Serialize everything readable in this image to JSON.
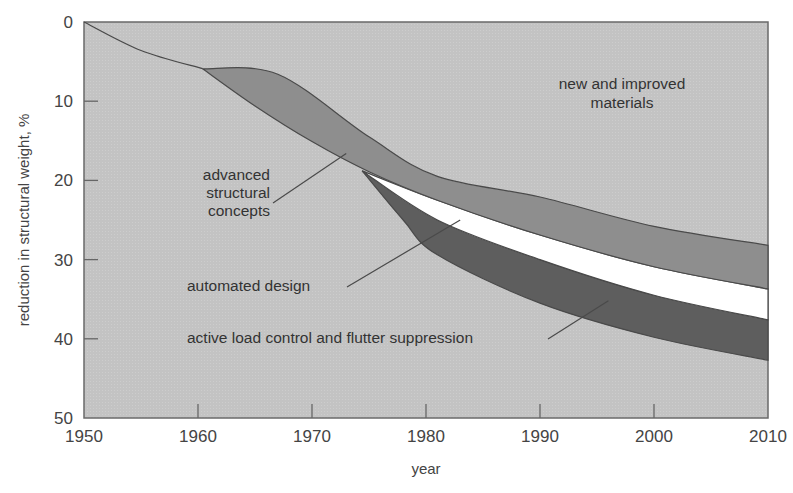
{
  "chart_data": {
    "type": "area",
    "title": "",
    "xlabel": "year",
    "ylabel": "reduction in structural weight, %",
    "xlim": [
      1950,
      2010
    ],
    "ylim": [
      50,
      0
    ],
    "y_inverted": true,
    "x_ticks": [
      1950,
      1960,
      1970,
      1980,
      1990,
      2000,
      2010
    ],
    "y_ticks": [
      0,
      10,
      20,
      30,
      40,
      50
    ],
    "grid": false,
    "legend": "none (inline annotations)",
    "series": [
      {
        "name": "new and improved materials",
        "role": "baseline curve / background region",
        "x": [
          1950,
          1955,
          1960.4
        ],
        "y": [
          0,
          3.6,
          5.9
        ]
      },
      {
        "name": "advanced structural concepts",
        "role": "band",
        "upper_edge": {
          "x": [
            1960.4,
            1967,
            1975,
            1981,
            1990,
            2000,
            2010
          ],
          "y": [
            5.9,
            6.6,
            14.5,
            19.5,
            22.1,
            25.8,
            28.2
          ]
        },
        "lower_edge": {
          "x": [
            1960.4,
            1965,
            1970,
            1975,
            1981,
            1990,
            2000,
            2010
          ],
          "y": [
            5.9,
            10.6,
            15.1,
            18.9,
            22.5,
            26.9,
            30.9,
            33.7
          ]
        }
      },
      {
        "name": "automated design",
        "role": "band",
        "upper_edge": {
          "x": [
            1974.4,
            1981,
            1990,
            2000,
            2010
          ],
          "y": [
            18.8,
            22.5,
            26.9,
            30.9,
            33.7
          ]
        },
        "lower_edge": {
          "x": [
            1974.4,
            1981,
            1990,
            2000,
            2010
          ],
          "y": [
            18.8,
            25.0,
            30.0,
            34.5,
            37.6
          ]
        }
      },
      {
        "name": "active load control and flutter suppression",
        "role": "band",
        "upper_edge": {
          "x": [
            1974.4,
            1981,
            1990,
            2000,
            2010
          ],
          "y": [
            18.8,
            25.0,
            30.0,
            34.5,
            37.6
          ]
        },
        "lower_edge": {
          "x": [
            1974.4,
            1978,
            1981,
            1990,
            2000,
            2010
          ],
          "y": [
            18.8,
            25.0,
            29.4,
            35.5,
            39.8,
            42.7
          ]
        }
      }
    ],
    "annotations": [
      {
        "text": "new and improved materials",
        "x": 1996,
        "y": 10
      },
      {
        "text": "advanced structural concepts",
        "x": 1966,
        "y": 23,
        "pointer_to": [
          1973,
          16.6
        ]
      },
      {
        "text": "automated design",
        "x": 1965,
        "y": 33,
        "pointer_to": [
          1983,
          25
        ]
      },
      {
        "text": "active load control and flutter suppression",
        "x": 1972,
        "y": 40,
        "pointer_to": [
          1996,
          35.2
        ]
      }
    ]
  },
  "labels": {
    "ylabel": "reduction in structural weight, %",
    "xlabel": "year",
    "materials_line1": "new and improved",
    "materials_line2": "materials",
    "asc_line1": "advanced",
    "asc_line2": "structural",
    "asc_line3": "concepts",
    "automated": "automated design",
    "active": "active load control and flutter suppression"
  },
  "colors": {
    "background": "#c4c4c4",
    "asc_band": "#8e8e8e",
    "automated_band": "#ffffff",
    "active_band": "#5e5e5e",
    "lines": "#4a4a4a",
    "axis": "#666666"
  }
}
